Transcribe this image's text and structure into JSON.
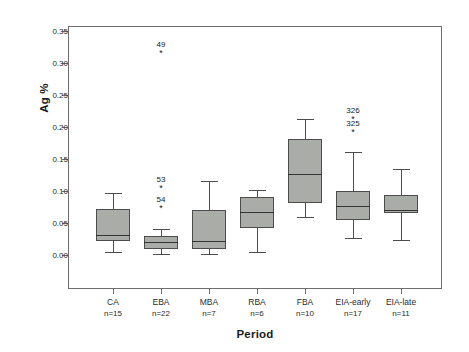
{
  "chart_data": {
    "type": "box",
    "title": "",
    "xlabel": "Period",
    "ylabel": "Ag %",
    "ylim": [
      -0.015,
      0.365
    ],
    "yticks": [
      0.0,
      0.05,
      0.1,
      0.15,
      0.2,
      0.25,
      0.3,
      0.35
    ],
    "ytick_labels": [
      "0.00",
      "0.05",
      "0.10",
      "0.15",
      "0.20",
      "0.25",
      "0.30",
      "0.35"
    ],
    "grid": false,
    "legend": null,
    "categories": [
      "CA",
      "EBA",
      "MBA",
      "RBA",
      "FBA",
      "EIA-early",
      "EIA-late"
    ],
    "counts": [
      "n=15",
      "n=22",
      "n=7",
      "n=6",
      "n=10",
      "n=17",
      "n=11"
    ],
    "boxes": [
      {
        "category": "CA",
        "count": "n=15",
        "whisker_low": 0.004,
        "q1": 0.022,
        "median": 0.031,
        "q3": 0.072,
        "whisker_high": 0.097,
        "outliers": []
      },
      {
        "category": "EBA",
        "count": "n=22",
        "whisker_low": 0.002,
        "q1": 0.01,
        "median": 0.02,
        "q3": 0.03,
        "whisker_high": 0.04,
        "outliers": [
          {
            "label": "49",
            "value": 0.315
          },
          {
            "label": "53",
            "value": 0.105
          },
          {
            "label": "54",
            "value": 0.074
          }
        ]
      },
      {
        "category": "MBA",
        "count": "n=7",
        "whisker_low": 0.002,
        "q1": 0.009,
        "median": 0.022,
        "q3": 0.071,
        "whisker_high": 0.116,
        "outliers": []
      },
      {
        "category": "RBA",
        "count": "n=6",
        "whisker_low": 0.005,
        "q1": 0.042,
        "median": 0.067,
        "q3": 0.09,
        "whisker_high": 0.102,
        "outliers": []
      },
      {
        "category": "FBA",
        "count": "n=10",
        "whisker_low": 0.06,
        "q1": 0.081,
        "median": 0.127,
        "q3": 0.182,
        "whisker_high": 0.212,
        "outliers": []
      },
      {
        "category": "EIA-early",
        "count": "n=17",
        "whisker_low": 0.026,
        "q1": 0.055,
        "median": 0.077,
        "q3": 0.1,
        "whisker_high": 0.161,
        "outliers": [
          {
            "label": "326",
            "value": 0.212
          },
          {
            "label": "325",
            "value": 0.192
          }
        ]
      },
      {
        "category": "EIA-late",
        "count": "n=11",
        "whisker_low": 0.024,
        "q1": 0.066,
        "median": 0.07,
        "q3": 0.093,
        "whisker_high": 0.135,
        "outliers": []
      }
    ],
    "colors": {
      "box_fill": "#aaaca7",
      "box_edge": "#4d4d4d",
      "median": "#333333",
      "axis": "#6e6e6e",
      "text": "#1a1a1a",
      "background": "#ffffff"
    },
    "outlier_marker": "*"
  }
}
